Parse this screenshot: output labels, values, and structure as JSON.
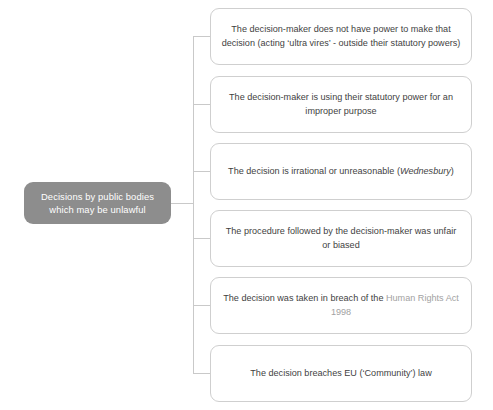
{
  "diagram": {
    "type": "tree",
    "orientation": "left-to-right",
    "root": {
      "label": "Decisions by public bodies\nwhich may be unlawful",
      "fill_color": "#8d8d8d",
      "text_color": "#ffffff"
    },
    "connector_color": "#c9c9c9",
    "branch_border_color": "#cfcfcf",
    "branches": [
      {
        "id": "ultra-vires",
        "text": "The decision-maker does not have power to make that decision (acting 'ultra vires' - outside their statutory powers)",
        "parts": [
          {
            "text": "The decision-maker does not have power to make that decision (acting ‘ultra vires’ - outside their statutory powers)",
            "style": "normal"
          }
        ]
      },
      {
        "id": "improper-purpose",
        "text": "The decision-maker is using their statutory power for an improper purpose",
        "parts": [
          {
            "text": "The decision-maker is using their statutory power for an improper purpose",
            "style": "normal"
          }
        ]
      },
      {
        "id": "irrationality",
        "text": "The decision is irrational or unreasonable (Wednesbury)",
        "parts": [
          {
            "text": "The decision is irrational or unreasonable (",
            "style": "normal"
          },
          {
            "text": "Wednesbury",
            "style": "italic"
          },
          {
            "text": ")",
            "style": "normal"
          }
        ]
      },
      {
        "id": "procedural-unfairness",
        "text": "The procedure followed by the decision-maker was unfair or biased",
        "parts": [
          {
            "text": "The procedure followed by the decision-maker was unfair or biased",
            "style": "normal"
          }
        ]
      },
      {
        "id": "human-rights-breach",
        "text": "The decision was taken in breach of the Human Rights Act 1998",
        "parts": [
          {
            "text": "The decision was taken in breach of the ",
            "style": "normal"
          },
          {
            "text": "Human Rights Act 1998",
            "style": "muted"
          }
        ]
      },
      {
        "id": "eu-law-breach",
        "text": "The decision breaches EU ('Community') law",
        "parts": [
          {
            "text": "The decision breaches EU (‘Community’) law",
            "style": "normal"
          }
        ]
      }
    ]
  }
}
